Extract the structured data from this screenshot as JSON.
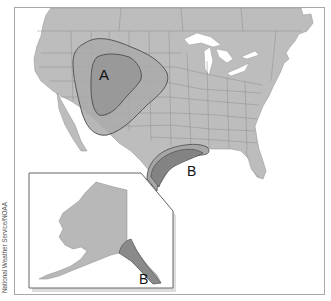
{
  "map": {
    "title": "",
    "credit": "National Weather Service/NOAA",
    "colors": {
      "land": "#bdbdbd",
      "water": "#ffffff",
      "borders": "#8e8e8e",
      "zone_outer": "#aaaaaa",
      "zone_inner": "#979797",
      "zone_b": "#8a8a8a",
      "outline": "#555555"
    },
    "regions": [
      {
        "id": "A",
        "label": "A",
        "description": "Rocky Mountain / central plains region with outer and inner contour zones"
      },
      {
        "id": "B-gulf",
        "label": "B",
        "description": "Gulf Coast region (Texas/Louisiana)"
      },
      {
        "id": "B-alaska",
        "label": "B",
        "description": "Southeast Alaska panhandle region"
      }
    ],
    "inset": {
      "name": "Alaska"
    }
  }
}
